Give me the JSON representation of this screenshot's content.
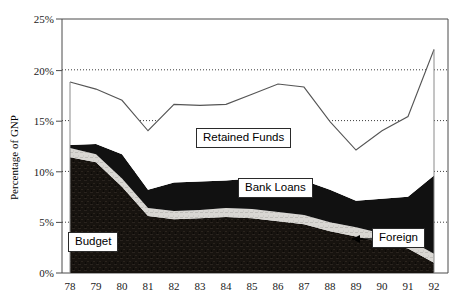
{
  "chart_data": {
    "type": "area",
    "title": "",
    "xlabel": "",
    "ylabel": "Percentage of GNP",
    "ylim": [
      0,
      25
    ],
    "xlim": [
      78,
      92
    ],
    "grid": "horizontal-dotted",
    "legend": "inline-callouts",
    "categories": [
      "78",
      "79",
      "80",
      "81",
      "82",
      "83",
      "84",
      "85",
      "86",
      "87",
      "88",
      "89",
      "90",
      "91",
      "92"
    ],
    "series": [
      {
        "name": "Budget",
        "values": [
          11.4,
          10.9,
          8.5,
          5.6,
          5.3,
          5.4,
          5.5,
          5.4,
          5.1,
          4.8,
          4.1,
          3.6,
          3.0,
          2.4,
          1.0
        ]
      },
      {
        "name": "Foreign",
        "values": [
          0.9,
          0.8,
          0.8,
          0.8,
          0.8,
          0.8,
          0.9,
          0.9,
          0.9,
          0.9,
          0.9,
          0.9,
          0.9,
          0.9,
          0.9
        ]
      },
      {
        "name": "Bank Loans",
        "values": [
          0.3,
          1.0,
          2.4,
          1.8,
          2.8,
          2.8,
          2.7,
          3.0,
          3.3,
          3.4,
          3.2,
          2.6,
          3.4,
          4.2,
          7.7
        ]
      },
      {
        "name": "Retained Funds",
        "values": [
          6.2,
          5.4,
          5.3,
          5.8,
          7.7,
          7.5,
          7.5,
          8.3,
          9.3,
          9.2,
          6.7,
          5.0,
          6.7,
          7.9,
          12.4
        ]
      }
    ],
    "total_line": [
      18.8,
      18.1,
      17.0,
      14.0,
      16.6,
      16.5,
      16.6,
      17.6,
      18.6,
      18.3,
      14.9,
      12.1,
      14.0,
      15.4,
      22.0
    ],
    "yticks": [
      "0%",
      "5%",
      "10%",
      "15%",
      "20%",
      "25%"
    ],
    "ytick_values": [
      0,
      5,
      10,
      15,
      20,
      25
    ],
    "band_colors": {
      "budget": "#1a1614",
      "foreign": "#d8d6d2",
      "bank_loans": "#111111",
      "retained_funds": "#ffffff",
      "total_line": "#555555",
      "axis": "#4a4a4a"
    }
  },
  "axis": {
    "y_title": "Percentage of GNP",
    "y_ticks": [
      "25%",
      "20%",
      "15%",
      "10%",
      "5%",
      "0%"
    ],
    "x_ticks": [
      "78",
      "79",
      "80",
      "81",
      "82",
      "83",
      "84",
      "85",
      "86",
      "87",
      "88",
      "89",
      "90",
      "91",
      "92"
    ]
  },
  "callouts": {
    "retained_funds": "Retained Funds",
    "bank_loans": "Bank Loans",
    "budget": "Budget",
    "foreign": "Foreign"
  }
}
